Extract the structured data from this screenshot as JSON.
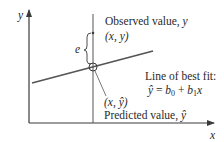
{
  "diagram": {
    "axes": {
      "x_label": "x",
      "y_label": "y"
    },
    "error_label": "e",
    "observed": {
      "title": "Observed value, ",
      "title_var": "y",
      "point": "(x, y)"
    },
    "fit": {
      "title": "Line of best fit:",
      "equation_lhs": "ŷ",
      "equation_eq": " = ",
      "equation_b0": "b",
      "equation_b0_sub": "0",
      "equation_plus": " + ",
      "equation_b1": "b",
      "equation_b1_sub": "1",
      "equation_x": "x"
    },
    "predicted": {
      "point": "(x, ŷ)",
      "title": "Predicted value, ",
      "title_var": "ŷ"
    },
    "colors": {
      "axis": "#3a3a3a",
      "line": "#555555",
      "text": "#2a2a2a"
    }
  }
}
